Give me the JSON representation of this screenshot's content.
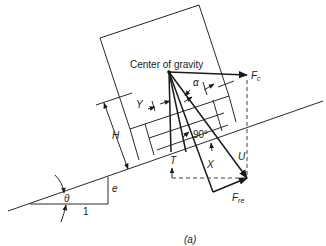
{
  "figure": {
    "caption": "(a)",
    "labels": {
      "center_of_gravity": "Center of gravity",
      "fc": "F",
      "fc_sub": "c",
      "fre": "F",
      "fre_sub": "re",
      "alpha": "α",
      "y": "Y",
      "h": "H",
      "angle_90": "90°",
      "t": "T",
      "x": "X",
      "u": "U",
      "e": "e",
      "theta": "θ",
      "one": "1"
    }
  }
}
